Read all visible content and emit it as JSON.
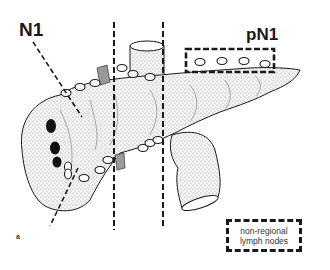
{
  "figure": {
    "panel_label": "a",
    "labels": {
      "n1": "N1",
      "pn1": "pN1"
    },
    "legend": {
      "line1": "non-regional",
      "line2": "lymph nodes",
      "style": "dashed-box"
    },
    "colors": {
      "ink": "#1a1a1a",
      "stipple": "#bdbdbd",
      "vessel_grey": "#9a9a9a",
      "background": "#ffffff"
    }
  }
}
